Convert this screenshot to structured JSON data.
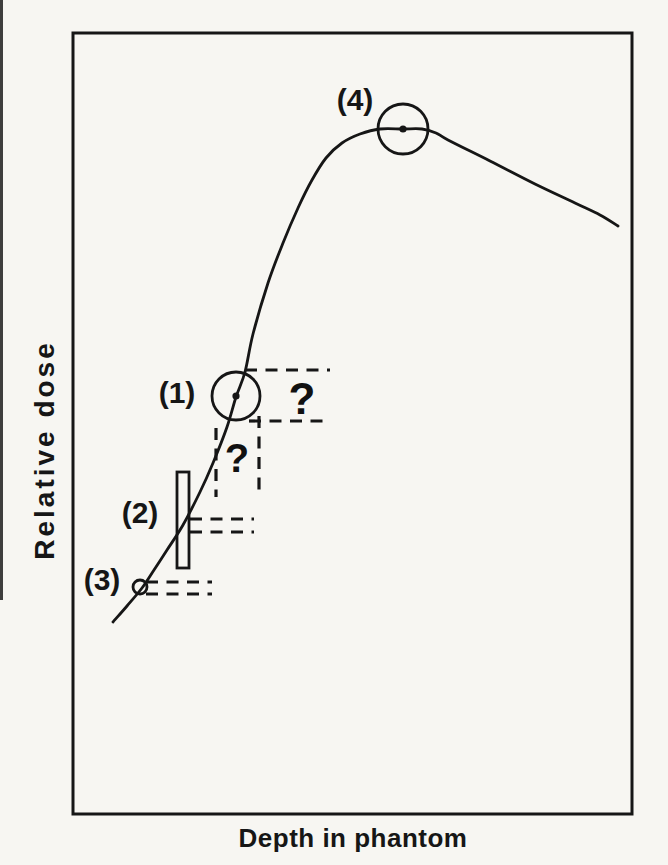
{
  "figure": {
    "background_color": "#f7f6f2",
    "ink_color": "#161616",
    "ylabel": "Relative dose",
    "xlabel": "Depth in phantom"
  },
  "chart_data": {
    "type": "line",
    "title": "",
    "xlabel": "Depth in phantom",
    "ylabel": "Relative dose",
    "axis_style": "schematic unlabeled axes, no ticks, no numbers, closed rectangular frame",
    "legend": "none",
    "grid": false,
    "plot_box_px": {
      "x": 73,
      "y": 33,
      "width": 559,
      "height": 781
    },
    "curve_points_px": [
      [
        113,
        622
      ],
      [
        127,
        606
      ],
      [
        142,
        588
      ],
      [
        154,
        570
      ],
      [
        167,
        550
      ],
      [
        183,
        525
      ],
      [
        200,
        492
      ],
      [
        213,
        463
      ],
      [
        227,
        427
      ],
      [
        236,
        397
      ],
      [
        245,
        372
      ],
      [
        253,
        334
      ],
      [
        268,
        283
      ],
      [
        283,
        243
      ],
      [
        298,
        208
      ],
      [
        312,
        180
      ],
      [
        326,
        158
      ],
      [
        342,
        143
      ],
      [
        360,
        134
      ],
      [
        380,
        129
      ],
      [
        403,
        129
      ],
      [
        422,
        129
      ],
      [
        436,
        133
      ],
      [
        448,
        140
      ],
      [
        490,
        161
      ],
      [
        535,
        184
      ],
      [
        575,
        203
      ],
      [
        600,
        215
      ],
      [
        618,
        226
      ]
    ],
    "markers": [
      {
        "label": "(4)",
        "kind": "circle-detector",
        "center_px": [
          403,
          129
        ],
        "radius_px": 25,
        "center_dot": true,
        "label_px": [
          355,
          99
        ]
      },
      {
        "label": "(1)",
        "kind": "circle-detector",
        "center_px": [
          236,
          396
        ],
        "radius_px": 24,
        "center_dot": true,
        "label_px": [
          177,
          392
        ]
      },
      {
        "label": "(2)",
        "kind": "thin-rect-detector",
        "rect_px": [
          177,
          472,
          12,
          96
        ],
        "label_px": [
          140,
          512
        ]
      },
      {
        "label": "(3)",
        "kind": "small-circle-detector",
        "center_px": [
          140,
          587
        ],
        "radius_px": 7,
        "center_dot": false,
        "label_px": [
          102,
          579
        ]
      }
    ],
    "question_marks": [
      {
        "text": "?",
        "center_px": [
          302,
          398
        ],
        "font_px": 44
      },
      {
        "text": "?",
        "center_px": [
          237,
          458
        ],
        "font_px": 40
      }
    ],
    "dashed_lines_px": [
      {
        "name": "uncertainty-h-top",
        "x1": 245,
        "y1": 370,
        "x2": 330,
        "y2": 370
      },
      {
        "name": "uncertainty-h-bottom",
        "x1": 249,
        "y1": 421,
        "x2": 331,
        "y2": 421
      },
      {
        "name": "uncertainty-v-left",
        "x1": 216,
        "y1": 428,
        "x2": 216,
        "y2": 497
      },
      {
        "name": "uncertainty-v-right",
        "x1": 259,
        "y1": 416,
        "x2": 259,
        "y2": 497
      },
      {
        "name": "detector2-level-top",
        "x1": 190,
        "y1": 519,
        "x2": 254,
        "y2": 519
      },
      {
        "name": "detector2-level-bottom",
        "x1": 190,
        "y1": 532,
        "x2": 254,
        "y2": 532
      },
      {
        "name": "detector3-level-top",
        "x1": 146,
        "y1": 582,
        "x2": 212,
        "y2": 582
      },
      {
        "name": "detector3-level-bottom",
        "x1": 146,
        "y1": 594,
        "x2": 212,
        "y2": 594
      }
    ]
  }
}
